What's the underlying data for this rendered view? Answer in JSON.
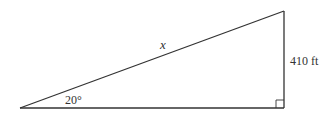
{
  "diagram": {
    "type": "right-triangle",
    "labels": {
      "hypotenuse": "x",
      "angle": "20°",
      "opposite_side": "410 ft"
    },
    "colors": {
      "stroke": "#333333",
      "background": "#ffffff"
    }
  }
}
